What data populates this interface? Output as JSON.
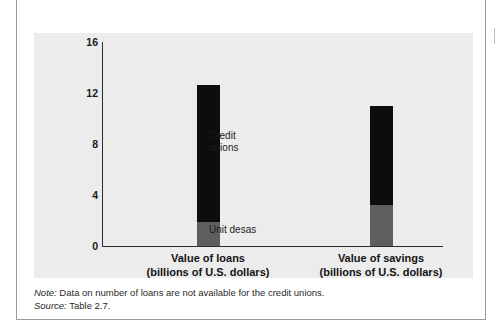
{
  "figure": {
    "clipped_title": "",
    "note_key": "Note:",
    "note_text": " Data on number of loans are not available for the credit unions.",
    "source_key": "Source:",
    "source_text": " Table 2.7."
  },
  "colors": {
    "panel_background": "#ececec",
    "credit_unions": "#0d0d0d",
    "unit_desas": "#5e5e5e",
    "axis": "#2b2b2b",
    "frame": "#9a9a9a",
    "page_background": "#ffffff"
  },
  "chart_data": {
    "type": "bar",
    "stacked": true,
    "title": "",
    "xlabel": "",
    "ylabel": "",
    "ylim": [
      0,
      16
    ],
    "yticks": [
      16,
      12,
      8,
      4,
      0
    ],
    "ytick_labels": [
      "16",
      "12",
      "8",
      "4",
      "0"
    ],
    "grid": false,
    "legend": "in-plot annotations",
    "categories": [
      "Value of loans\n(billions of U.S. dollars)",
      "Value of savings\n(billions of U.S. dollars)"
    ],
    "category_lines": [
      {
        "line1": "Value of loans",
        "line2": "(billions of U.S. dollars)"
      },
      {
        "line1": "Value of savings",
        "line2": "(billions of U.S. dollars)"
      }
    ],
    "series": [
      {
        "name": "Unit desas",
        "values": [
          1.9,
          3.2
        ],
        "color": "#5e5e5e"
      },
      {
        "name": "Credit unions",
        "values": [
          10.7,
          7.8
        ],
        "color": "#0d0d0d"
      }
    ],
    "totals": [
      12.6,
      11.0
    ],
    "annotations": [
      {
        "text": "Credit\nunions",
        "line1": "Credit",
        "line2": "unions"
      },
      {
        "text": "Unit desas",
        "line1": "Unit desas",
        "line2": ""
      }
    ]
  }
}
